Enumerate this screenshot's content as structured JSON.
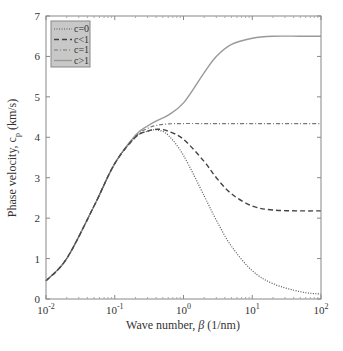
{
  "chart_data": {
    "type": "line",
    "title": "",
    "xlabel": "Wave number, β (1/nm)",
    "ylabel": "Phase velocity, c_p (km/s)",
    "xscale": "log",
    "xlim": [
      0.01,
      100
    ],
    "ylim": [
      0,
      7
    ],
    "xticks": [
      "10^-2",
      "10^-1",
      "10^0",
      "10^1",
      "10^2"
    ],
    "yticks": [
      "0",
      "1",
      "2",
      "3",
      "4",
      "5",
      "6",
      "7"
    ],
    "grid": false,
    "legend_position": "upper left",
    "x": [
      0.01,
      0.02,
      0.05,
      0.1,
      0.2,
      0.3,
      0.42,
      0.6,
      1,
      2,
      3,
      5,
      10,
      20,
      50,
      100
    ],
    "series": [
      {
        "name": "c=0",
        "style": "dotted",
        "values": [
          0.45,
          1.0,
          2.3,
          3.35,
          4.0,
          4.15,
          4.18,
          4.05,
          3.55,
          2.55,
          1.95,
          1.3,
          0.7,
          0.38,
          0.18,
          0.12
        ]
      },
      {
        "name": "c<1",
        "style": "dashed",
        "values": [
          0.45,
          1.0,
          2.3,
          3.35,
          4.0,
          4.15,
          4.2,
          4.15,
          3.95,
          3.4,
          3.0,
          2.6,
          2.3,
          2.2,
          2.18,
          2.18
        ]
      },
      {
        "name": "c=1",
        "style": "dashdot",
        "values": [
          0.45,
          1.0,
          2.3,
          3.35,
          4.02,
          4.22,
          4.3,
          4.33,
          4.34,
          4.34,
          4.34,
          4.34,
          4.34,
          4.34,
          4.34,
          4.34
        ]
      },
      {
        "name": "c>1",
        "style": "solid",
        "values": [
          0.45,
          1.0,
          2.3,
          3.35,
          4.05,
          4.28,
          4.42,
          4.55,
          4.85,
          5.6,
          6.0,
          6.3,
          6.45,
          6.5,
          6.5,
          6.5
        ]
      }
    ]
  },
  "legend": {
    "items": [
      "c=0",
      "c<1",
      "c=1",
      "c>1"
    ]
  },
  "labels": {
    "xlabel_prefix": "Wave number, ",
    "xlabel_beta": "β",
    "xlabel_suffix": " (1/nm)",
    "ylabel_prefix": "Phase velocity, c",
    "ylabel_sub": "p",
    "ylabel_suffix": " (km/s)"
  }
}
